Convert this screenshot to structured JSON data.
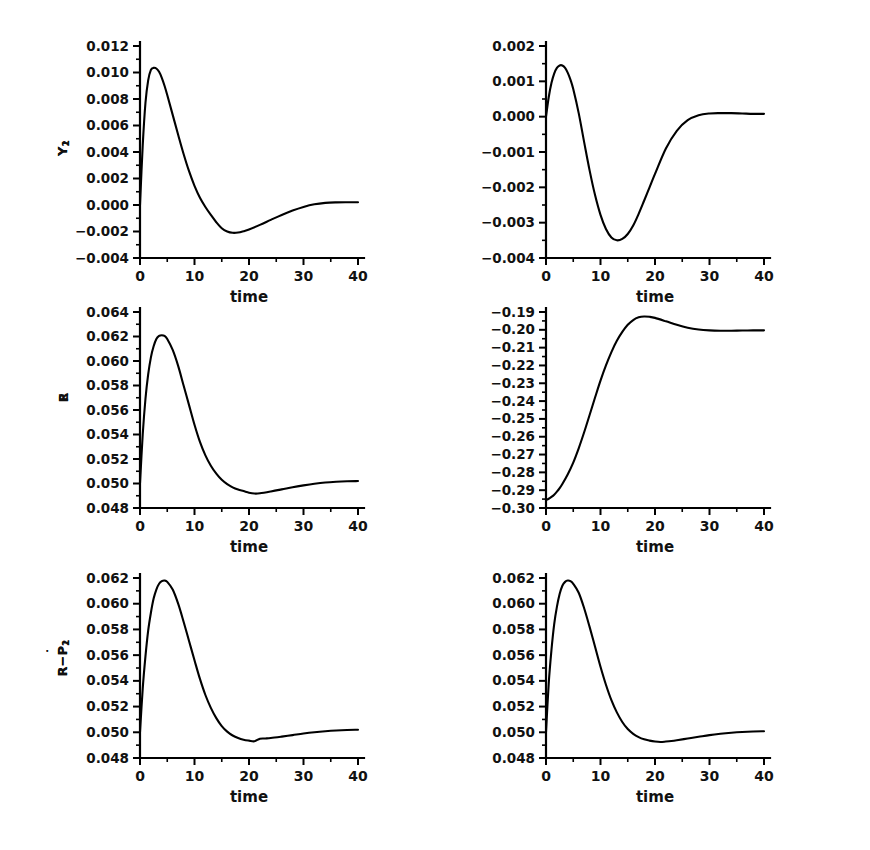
{
  "figure": {
    "background": "#ffffff",
    "line_color": "#000000",
    "text_color": "#111111",
    "axis_color": "#000000"
  },
  "chart_data": [
    {
      "type": "line",
      "name": "panel-y1",
      "title": "",
      "xlabel": "time",
      "ylabel": "Y_1",
      "ylabel_base": "Y",
      "ylabel_sub": "1",
      "xlim": [
        0,
        40
      ],
      "ylim": [
        -0.004,
        0.012
      ],
      "xticks": [
        0,
        10,
        20,
        30,
        40
      ],
      "xticklabels": [
        "0",
        "10",
        "20",
        "30",
        "40"
      ],
      "yticks": [
        -0.004,
        -0.002,
        0.0,
        0.002,
        0.004,
        0.006,
        0.008,
        0.01,
        0.012
      ],
      "yticklabels": [
        "-0.004",
        "-0.002",
        "0.000",
        "0.002",
        "0.004",
        "0.006",
        "0.008",
        "0.010",
        "0.012"
      ],
      "grid": false,
      "legend": "none",
      "x": [
        0,
        0.5,
        1,
        1.5,
        2,
        2.5,
        3,
        3.5,
        4,
        4.5,
        5,
        6,
        7,
        8,
        9,
        10,
        11,
        12,
        13,
        14,
        15,
        16,
        17,
        18,
        19,
        20,
        22,
        24,
        26,
        28,
        30,
        32,
        34,
        36,
        38,
        40
      ],
      "y": [
        0.0,
        0.0045,
        0.0077,
        0.0094,
        0.0102,
        0.01035,
        0.0103,
        0.01005,
        0.0096,
        0.009,
        0.0083,
        0.0068,
        0.0053,
        0.00385,
        0.00255,
        0.00145,
        0.00055,
        -0.00015,
        -0.00075,
        -0.0013,
        -0.00175,
        -0.002,
        -0.0021,
        -0.00208,
        -0.00198,
        -0.00185,
        -0.0015,
        -0.00112,
        -0.00075,
        -0.00042,
        -0.00015,
        5e-05,
        0.00016,
        0.0002,
        0.00021,
        0.00021
      ]
    },
    {
      "type": "line",
      "name": "panel-y2",
      "title": "",
      "xlabel": "time",
      "ylabel": "Y_2",
      "ylabel_base": "Y",
      "ylabel_sub": "2",
      "xlim": [
        0,
        40
      ],
      "ylim": [
        -0.004,
        0.002
      ],
      "xticks": [
        0,
        10,
        20,
        30,
        40
      ],
      "xticklabels": [
        "0",
        "10",
        "20",
        "30",
        "40"
      ],
      "yticks": [
        -0.004,
        -0.003,
        -0.002,
        -0.001,
        0.0,
        0.001,
        0.002
      ],
      "yticklabels": [
        "-0.004",
        "-0.003",
        "-0.002",
        "-0.001",
        "0.000",
        "0.001",
        "0.002"
      ],
      "grid": false,
      "legend": "none",
      "x": [
        0,
        0.5,
        1,
        1.5,
        2,
        2.5,
        3,
        3.5,
        4,
        4.5,
        5,
        6,
        7,
        8,
        9,
        10,
        11,
        12,
        13,
        14,
        15,
        16,
        17,
        18,
        19,
        20,
        22,
        24,
        26,
        28,
        30,
        32,
        34,
        36,
        38,
        40
      ],
      "y": [
        0.0,
        0.00055,
        0.00095,
        0.00122,
        0.00138,
        0.00145,
        0.00145,
        0.00138,
        0.00124,
        0.00104,
        0.00078,
        0.0001,
        -0.00072,
        -0.00152,
        -0.00222,
        -0.00278,
        -0.00318,
        -0.00342,
        -0.0035,
        -0.00346,
        -0.00332,
        -0.00308,
        -0.00275,
        -0.00238,
        -0.002,
        -0.00162,
        -0.0009,
        -0.0004,
        -0.0001,
        4e-05,
        9e-05,
        0.0001,
        0.0001,
        9e-05,
        8e-05,
        8e-05
      ]
    },
    {
      "type": "line",
      "name": "panel-r",
      "title": "",
      "xlabel": "time",
      "ylabel": "R",
      "ylabel_base": "R",
      "ylabel_sub": "",
      "xlim": [
        0,
        40
      ],
      "ylim": [
        0.048,
        0.064
      ],
      "xticks": [
        0,
        10,
        20,
        30,
        40
      ],
      "xticklabels": [
        "0",
        "10",
        "20",
        "30",
        "40"
      ],
      "yticks": [
        0.048,
        0.05,
        0.052,
        0.054,
        0.056,
        0.058,
        0.06,
        0.062,
        0.064
      ],
      "yticklabels": [
        "0.048",
        "0.050",
        "0.052",
        "0.054",
        "0.056",
        "0.058",
        "0.060",
        "0.062",
        "0.064"
      ],
      "grid": false,
      "legend": "none",
      "x": [
        0,
        0.5,
        1,
        1.5,
        2,
        2.5,
        3,
        3.5,
        4,
        4.5,
        5,
        6,
        7,
        8,
        9,
        10,
        11,
        12,
        13,
        14,
        15,
        16,
        17,
        18,
        19,
        20,
        21,
        22,
        24,
        26,
        28,
        30,
        32,
        34,
        36,
        38,
        40
      ],
      "y": [
        0.05,
        0.054,
        0.0569,
        0.0589,
        0.0603,
        0.0612,
        0.0618,
        0.06205,
        0.0621,
        0.06205,
        0.0618,
        0.0609,
        0.0596,
        0.058,
        0.0564,
        0.0548,
        0.0534,
        0.0523,
        0.05145,
        0.0508,
        0.0503,
        0.04995,
        0.04968,
        0.0495,
        0.04938,
        0.04925,
        0.04918,
        0.0492,
        0.04935,
        0.04952,
        0.0497,
        0.04985,
        0.04998,
        0.05008,
        0.05014,
        0.05018,
        0.0502
      ]
    },
    {
      "type": "line",
      "name": "panel-e",
      "title": "",
      "xlabel": "time",
      "ylabel": "E",
      "ylabel_base": "E",
      "ylabel_sub": "",
      "xlim": [
        0,
        40
      ],
      "ylim": [
        -0.3,
        -0.19
      ],
      "xticks": [
        0,
        10,
        20,
        30,
        40
      ],
      "xticklabels": [
        "0",
        "10",
        "20",
        "30",
        "40"
      ],
      "yticks": [
        -0.3,
        -0.29,
        -0.28,
        -0.27,
        -0.26,
        -0.25,
        -0.24,
        -0.23,
        -0.22,
        -0.21,
        -0.2,
        -0.19
      ],
      "yticklabels": [
        "-0.30",
        "-0.29",
        "-0.28",
        "-0.27",
        "-0.26",
        "-0.25",
        "-0.24",
        "-0.23",
        "-0.22",
        "-0.21",
        "-0.20",
        "-0.19"
      ],
      "grid": false,
      "legend": "none",
      "x": [
        0,
        0.5,
        1,
        1.5,
        2,
        2.5,
        3,
        4,
        5,
        6,
        7,
        8,
        9,
        10,
        11,
        12,
        13,
        14,
        15,
        16,
        17,
        18,
        19,
        20,
        22,
        24,
        26,
        28,
        30,
        32,
        34,
        36,
        38,
        40
      ],
      "y": [
        -0.2955,
        -0.2948,
        -0.2938,
        -0.2925,
        -0.2908,
        -0.2888,
        -0.2865,
        -0.281,
        -0.2745,
        -0.2665,
        -0.2575,
        -0.2478,
        -0.238,
        -0.2285,
        -0.22,
        -0.2125,
        -0.2062,
        -0.2012,
        -0.1972,
        -0.1945,
        -0.193,
        -0.1925,
        -0.1927,
        -0.1933,
        -0.1952,
        -0.1972,
        -0.1988,
        -0.1998,
        -0.2003,
        -0.2005,
        -0.2005,
        -0.2004,
        -0.2003,
        -0.2003
      ]
    },
    {
      "type": "line",
      "name": "panel-r-minus-pdot1",
      "title": "",
      "xlabel": "time",
      "ylabel": "R-P_1_dot",
      "ylabel_base": "R−P",
      "ylabel_sub": "1",
      "xlim": [
        0,
        40
      ],
      "ylim": [
        0.048,
        0.062
      ],
      "xticks": [
        0,
        10,
        20,
        30,
        40
      ],
      "xticklabels": [
        "0",
        "10",
        "20",
        "30",
        "40"
      ],
      "yticks": [
        0.048,
        0.05,
        0.052,
        0.054,
        0.056,
        0.058,
        0.06,
        0.062
      ],
      "yticklabels": [
        "0.048",
        "0.050",
        "0.052",
        "0.054",
        "0.056",
        "0.058",
        "0.060",
        "0.062"
      ],
      "grid": false,
      "legend": "none",
      "x": [
        0,
        0.5,
        1,
        1.5,
        2,
        2.5,
        3,
        3.5,
        4,
        4.5,
        5,
        6,
        7,
        8,
        9,
        10,
        11,
        12,
        13,
        14,
        15,
        16,
        17,
        18,
        19,
        20,
        21,
        22,
        23,
        24,
        26,
        28,
        30,
        32,
        34,
        36,
        38,
        40
      ],
      "y": [
        0.05,
        0.0534,
        0.0559,
        0.0579,
        0.0593,
        0.0604,
        0.0611,
        0.06155,
        0.06175,
        0.0618,
        0.0617,
        0.0611,
        0.06,
        0.0586,
        0.0571,
        0.0556,
        0.05415,
        0.0529,
        0.0519,
        0.0511,
        0.05048,
        0.05005,
        0.04975,
        0.04955,
        0.04942,
        0.04935,
        0.0493,
        0.0495,
        0.04952,
        0.04955,
        0.04966,
        0.04978,
        0.0499,
        0.05,
        0.05008,
        0.05014,
        0.05018,
        0.0502
      ]
    },
    {
      "type": "line",
      "name": "panel-r-minus-pdot2",
      "title": "",
      "xlabel": "time",
      "ylabel": "R-P_2_dot",
      "ylabel_base": "R−P",
      "ylabel_sub": "2",
      "xlim": [
        0,
        40
      ],
      "ylim": [
        0.048,
        0.062
      ],
      "xticks": [
        0,
        10,
        20,
        30,
        40
      ],
      "xticklabels": [
        "0",
        "10",
        "20",
        "30",
        "40"
      ],
      "yticks": [
        0.048,
        0.05,
        0.052,
        0.054,
        0.056,
        0.058,
        0.06,
        0.062
      ],
      "yticklabels": [
        "0.048",
        "0.050",
        "0.052",
        "0.054",
        "0.056",
        "0.058",
        "0.060",
        "0.062"
      ],
      "grid": false,
      "legend": "none",
      "x": [
        0,
        0.5,
        1,
        1.5,
        2,
        2.5,
        3,
        3.5,
        4,
        4.5,
        5,
        6,
        7,
        8,
        9,
        10,
        11,
        12,
        13,
        14,
        15,
        16,
        17,
        18,
        19,
        20,
        21,
        22,
        23,
        24,
        26,
        28,
        30,
        32,
        34,
        36,
        38,
        40
      ],
      "y": [
        0.05,
        0.0538,
        0.0564,
        0.0584,
        0.05975,
        0.06075,
        0.0614,
        0.0617,
        0.0618,
        0.06175,
        0.06155,
        0.06085,
        0.05965,
        0.0582,
        0.05665,
        0.0551,
        0.0537,
        0.0525,
        0.05155,
        0.0508,
        0.05025,
        0.04988,
        0.04962,
        0.04945,
        0.04935,
        0.04928,
        0.04925,
        0.04928,
        0.04932,
        0.04938,
        0.04952,
        0.04965,
        0.04978,
        0.04988,
        0.04996,
        0.05002,
        0.05006,
        0.05008
      ]
    }
  ]
}
